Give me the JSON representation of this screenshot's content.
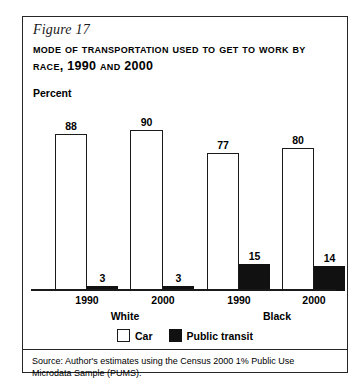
{
  "figure": {
    "number": "Figure 17",
    "title": "Mode of Transportation Used to Get to Work by Race, 1990 and 2000",
    "y_axis_label": "Percent",
    "source": "Source: Author's estimates using the Census 2000 1% Public Use Microdata Sample (PUMS)."
  },
  "chart_data": {
    "type": "bar",
    "title": "Mode of Transportation Used to Get to Work by Race, 1990 and 2000",
    "xlabel": "",
    "ylabel": "Percent",
    "ylim": [
      0,
      100
    ],
    "grid": false,
    "legend_position": "bottom",
    "categories": [
      "1990",
      "2000",
      "1990",
      "2000"
    ],
    "group_labels": [
      "White",
      "Black"
    ],
    "groups": [
      {
        "race": "White",
        "years": [
          "1990",
          "2000"
        ]
      },
      {
        "race": "Black",
        "years": [
          "1990",
          "2000"
        ]
      }
    ],
    "series": [
      {
        "name": "Car",
        "color": "#ffffff",
        "values": [
          88,
          90,
          77,
          80
        ]
      },
      {
        "name": "Public transit",
        "color": "#111111",
        "values": [
          3,
          3,
          15,
          14
        ]
      }
    ],
    "data_labels": [
      "88",
      "3",
      "90",
      "3",
      "77",
      "15",
      "80",
      "14"
    ],
    "annotations": []
  },
  "bars": [
    {
      "name": "white-1990-car",
      "label": "88",
      "value": 88,
      "series": "Car",
      "left": 24,
      "width": 32
    },
    {
      "name": "white-1990-transit",
      "label": "3",
      "value": 3,
      "series": "Public transit",
      "left": 56,
      "width": 31
    },
    {
      "name": "white-2000-car",
      "label": "90",
      "value": 90,
      "series": "Car",
      "left": 99,
      "width": 33
    },
    {
      "name": "white-2000-transit",
      "label": "3",
      "value": 3,
      "series": "Public transit",
      "left": 132,
      "width": 31
    },
    {
      "name": "black-1990-car",
      "label": "77",
      "value": 77,
      "series": "Car",
      "left": 176,
      "width": 32
    },
    {
      "name": "black-1990-transit",
      "label": "15",
      "value": 15,
      "series": "Public transit",
      "left": 208,
      "width": 31
    },
    {
      "name": "black-2000-car",
      "label": "80",
      "value": 80,
      "series": "Car",
      "left": 251,
      "width": 32
    },
    {
      "name": "black-2000-transit",
      "label": "14",
      "value": 14,
      "series": "Public transit",
      "left": 283,
      "width": 31
    }
  ],
  "ticks": [
    {
      "label": "1990",
      "center": 56
    },
    {
      "label": "2000",
      "center": 132
    },
    {
      "label": "1990",
      "center": 208
    },
    {
      "label": "2000",
      "center": 283
    }
  ],
  "group_ticks": [
    {
      "label": "White",
      "center": 94
    },
    {
      "label": "Black",
      "center": 246
    }
  ],
  "legend": [
    {
      "label": "Car",
      "swatch": "car"
    },
    {
      "label": "Public transit",
      "swatch": "transit"
    }
  ]
}
